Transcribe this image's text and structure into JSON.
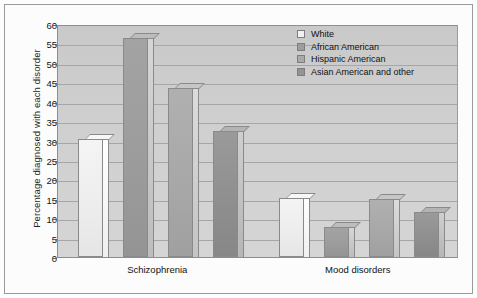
{
  "chart_data": {
    "type": "bar",
    "title": "",
    "xlabel": "",
    "ylabel": "Percentage diagnosed with each disorder",
    "ylim": [
      0,
      60
    ],
    "ytick_step": 5,
    "yticks": [
      0,
      5,
      10,
      15,
      20,
      25,
      30,
      35,
      40,
      45,
      50,
      55,
      60
    ],
    "grid": true,
    "legend_position": "top-right",
    "categories": [
      "Schizophrenia",
      "Mood disorders"
    ],
    "series": [
      {
        "name": "White",
        "values": [
          30.5,
          15.3
        ]
      },
      {
        "name": "African American",
        "values": [
          56.5,
          7.7
        ]
      },
      {
        "name": "Hispanic American",
        "values": [
          43.5,
          15.0
        ]
      },
      {
        "name": "Asian American and other",
        "values": [
          32.5,
          11.5
        ]
      }
    ],
    "colors": {
      "White": "#f1f1f1",
      "African American": "#9d9d9d",
      "Hispanic American": "#aaaaaa",
      "Asian American and other": "#939393",
      "plot_background": "#cfcfcf",
      "gridline": "#a6a6a6",
      "axis": "#8d8d8d",
      "text": "#111111"
    }
  }
}
